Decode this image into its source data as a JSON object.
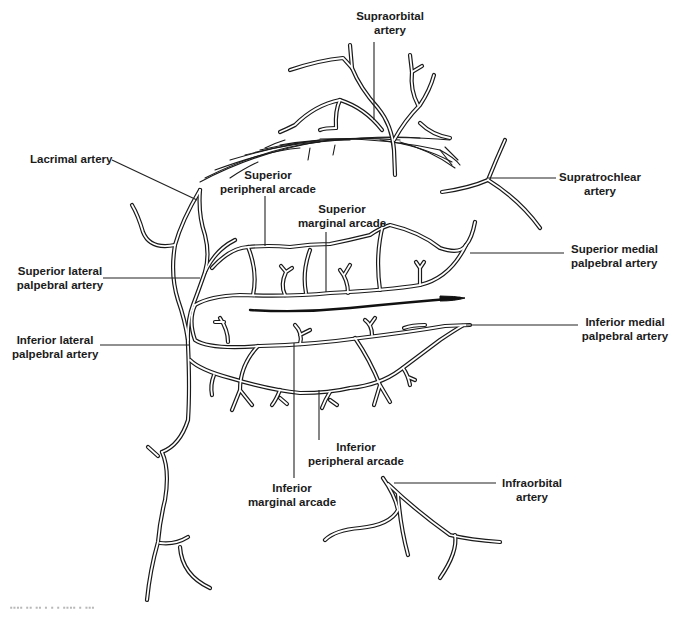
{
  "figure": {
    "labels": {
      "supraorbital": [
        "Supraorbital",
        "artery"
      ],
      "lacrimal": [
        "Lacrimal artery"
      ],
      "supratrochlear": [
        "Supratrochlear",
        "artery"
      ],
      "superior_peripheral_arcade": [
        "Superior",
        "peripheral arcade"
      ],
      "superior_marginal_arcade": [
        "Superior",
        "marginal arcade"
      ],
      "superior_medial_palpebral": [
        "Superior medial",
        "palpebral artery"
      ],
      "superior_lateral_palpebral": [
        "Superior lateral",
        "palpebral artery"
      ],
      "inferior_lateral_palpebral": [
        "Inferior lateral",
        "palpebral artery"
      ],
      "inferior_medial_palpebral": [
        "Inferior medial",
        "palpebral artery"
      ],
      "inferior_peripheral_arcade": [
        "Inferior",
        "peripheral arcade"
      ],
      "inferior_marginal_arcade": [
        "Inferior",
        "marginal arcade"
      ],
      "infraorbital": [
        "Infraorbital",
        "artery"
      ]
    },
    "caption": "▪▪▪▪ ▪▪ ▪▪ ▪ ▪ ▪ ▪▪▪▪ ▪ ▪▪▪"
  },
  "colors": {
    "line": "#1a1a1a",
    "background": "#ffffff",
    "text": "#1b1b1b"
  }
}
